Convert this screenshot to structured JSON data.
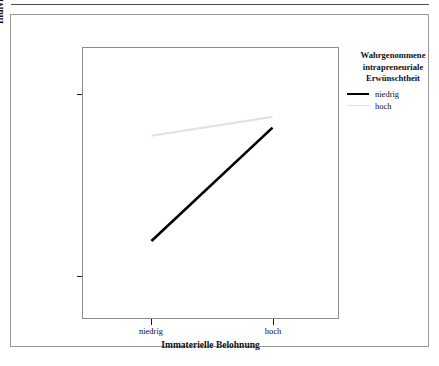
{
  "figure": {
    "x_axis_title": "Immaterielle Belohnung",
    "y_axis_title": "Individuelle Kreativität",
    "x_tick_labels": [
      "niedrig",
      "hoch"
    ],
    "y_tick_labels": [
      "hoch",
      "niedrig"
    ]
  },
  "legend": {
    "title_line1": "Wahrgenommene",
    "title_line2": "intrapreneuriale",
    "title_line3": "Erwünschtheit",
    "items": [
      {
        "label": "niedrig",
        "color": "#000000"
      },
      {
        "label": "hoch",
        "color": "#e2e2e2"
      }
    ]
  },
  "chart_data": {
    "type": "line",
    "title": "",
    "subtitle": "",
    "xlabel": "Immaterielle Belohnung",
    "ylabel": "Individuelle Kreativität",
    "categories": [
      "niedrig",
      "hoch"
    ],
    "xticklabels": [
      "niedrig",
      "hoch"
    ],
    "yticklabels": [
      "niedrig",
      "hoch"
    ],
    "ylim": [
      0,
      1
    ],
    "yticks": [
      0.155,
      0.825
    ],
    "grid": false,
    "legend_position": "right",
    "legend_title": "Wahrgenommene intrapreneuriale Erwünschtheit",
    "series": [
      {
        "name": "niedrig",
        "color": "#000000",
        "linewidth": 2.6,
        "x": [
          "niedrig",
          "hoch"
        ],
        "values": [
          0.285,
          0.705
        ]
      },
      {
        "name": "hoch",
        "color": "#e2e2e2",
        "linewidth": 2.2,
        "x": [
          "niedrig",
          "hoch"
        ],
        "values": [
          0.675,
          0.745
        ]
      }
    ],
    "annotations": []
  }
}
